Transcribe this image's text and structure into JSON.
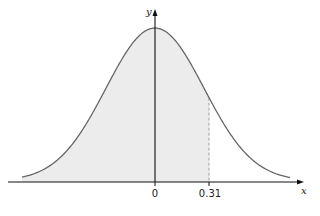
{
  "chart_data": {
    "type": "area",
    "title": "",
    "xlabel": "x",
    "ylabel": "y",
    "x_tick_labels": [
      "0",
      "0.31"
    ],
    "x_ticks": [
      0,
      0.31
    ],
    "curve": "normal",
    "mean": 0,
    "shaded_region": {
      "from": "-inf",
      "to": 0.31
    },
    "reference_line": {
      "x": 0.31,
      "style": "dashed"
    },
    "grid": false,
    "legend": null
  },
  "colors": {
    "curve": "#666666",
    "fill": "#ececec",
    "axis": "#111111",
    "dashed": "#888888"
  },
  "labels": {
    "x_axis": "x",
    "y_axis": "y",
    "tick_zero": "0",
    "tick_value": "0.31"
  }
}
